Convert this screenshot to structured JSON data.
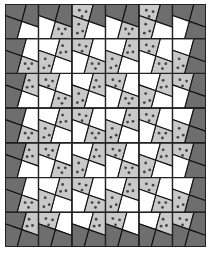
{
  "quilt": {
    "rows": 7,
    "cols": 6,
    "colors": {
      "D": "#6e6e6e",
      "L": "#c9c9c9",
      "W": "#ffffff",
      "dot": "#454545",
      "line": "#111111"
    },
    "legend": {
      "D": "dark-gray",
      "L": "light-gray-dotted",
      "W": "white"
    },
    "quadrant_order": [
      "TL",
      "TR",
      "BR",
      "BL"
    ],
    "cells": [
      [
        "DDWD",
        "DDLW",
        "LDWL",
        "DDLW",
        "LDWL",
        "DDDW"
      ],
      [
        "DWLD",
        "WLWL",
        "LWLW",
        "WLWL",
        "LWLW",
        "WDDL"
      ],
      [
        "DLWD",
        "LWLW",
        "WLWL",
        "LWLW",
        "WLWL",
        "LDDW"
      ],
      [
        "DWLD",
        "WLWL",
        "LWLW",
        "WLWL",
        "LWLW",
        "WDDL"
      ],
      [
        "DLWD",
        "LWLW",
        "WLWL",
        "LWLW",
        "WLWL",
        "LDDW"
      ],
      [
        "DWLD",
        "WLWL",
        "LWLW",
        "WLWL",
        "LWLW",
        "WDDL"
      ],
      [
        "DLDD",
        "LWDD",
        "WLDD",
        "LWDD",
        "WLDD",
        "LDDD"
      ]
    ]
  }
}
